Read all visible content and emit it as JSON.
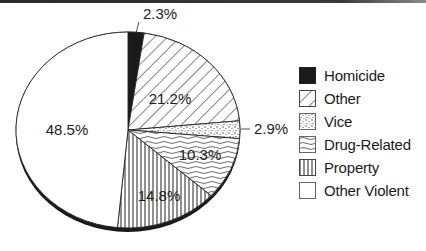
{
  "chart_data": {
    "type": "pie",
    "title": "",
    "style": "3d-pie-black-and-white-patterns",
    "start_angle_deg": 0,
    "direction": "clockwise",
    "slices": [
      {
        "label": "Homicide",
        "value": 2.3,
        "value_label": "2.3%",
        "pattern": "solid-black"
      },
      {
        "label": "Other",
        "value": 21.2,
        "value_label": "21.2%",
        "pattern": "diagonal-hatch"
      },
      {
        "label": "Vice",
        "value": 2.9,
        "value_label": "2.9%",
        "pattern": "stipple"
      },
      {
        "label": "Drug-Related",
        "value": 10.3,
        "value_label": "10.3%",
        "pattern": "wavy-lines"
      },
      {
        "label": "Property",
        "value": 14.8,
        "value_label": "14.8%",
        "pattern": "vertical-lines"
      },
      {
        "label": "Other Violent",
        "value": 48.5,
        "value_label": "48.5%",
        "pattern": "white"
      }
    ],
    "legend": {
      "position": "right",
      "entries": [
        "Homicide",
        "Other",
        "Vice",
        "Drug-Related",
        "Property",
        "Other Violent"
      ]
    }
  },
  "labels": {
    "homicide": "2.3%",
    "other": "21.2%",
    "vice": "2.9%",
    "drug": "10.3%",
    "property": "14.8%",
    "violent": "48.5%"
  },
  "legend": {
    "items": [
      {
        "label": "Homicide"
      },
      {
        "label": "Other"
      },
      {
        "label": "Vice"
      },
      {
        "label": "Drug-Related"
      },
      {
        "label": "Property"
      },
      {
        "label": "Other Violent"
      }
    ]
  }
}
